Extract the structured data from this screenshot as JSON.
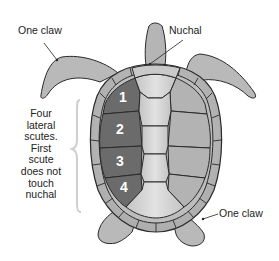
{
  "diagram": {
    "labels": {
      "front_flipper_claw": "One claw",
      "nuchal": "Nuchal",
      "rear_flipper_claw": "One claw",
      "note": "Four lateral scutes. First scute does not touch nuchal"
    },
    "lateral_scutes": [
      {
        "number": "1"
      },
      {
        "number": "2"
      },
      {
        "number": "3"
      },
      {
        "number": "4"
      }
    ],
    "colors": {
      "background": "#ffffff",
      "body": "#b9b9b9",
      "shell_light": "#c8c8c8",
      "vertebral": "#d6d6d6",
      "highlighted_scutes": "#6b6b6b",
      "outline": "#2a2a2a",
      "bracket": "#cfcfcf",
      "text": "#222222"
    }
  }
}
